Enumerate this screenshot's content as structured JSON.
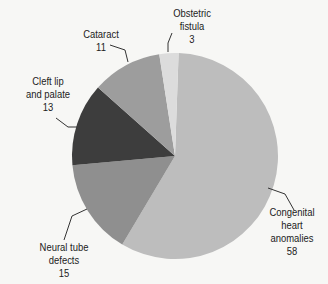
{
  "chart_data": {
    "type": "pie",
    "title": "",
    "categories": [
      "Congenital heart anomalies",
      "Neural tube defects",
      "Cleft lip and palate",
      "Cataract",
      "Obstetric fistula"
    ],
    "values": [
      58,
      15,
      13,
      11,
      3
    ],
    "colors": [
      "#bdbdbd",
      "#8f8f8f",
      "#3d3d3d",
      "#9d9d9d",
      "#dcdcdc"
    ],
    "start_angle_deg_clockwise_from_top": 2,
    "legend": "none (direct labels with leader lines)"
  },
  "labels": {
    "congenital": {
      "line1": "Congenital",
      "line2": "heart",
      "line3": "anomalies",
      "value": "58"
    },
    "neural": {
      "line1": "Neural tube",
      "line2": "defects",
      "value": "15"
    },
    "cleft": {
      "line1": "Cleft lip",
      "line2": "and palate",
      "value": "13"
    },
    "cataract": {
      "line1": "Cataract",
      "value": "11"
    },
    "obstetric": {
      "line1": "Obstetric",
      "line2": "fistula",
      "value": "3"
    }
  }
}
